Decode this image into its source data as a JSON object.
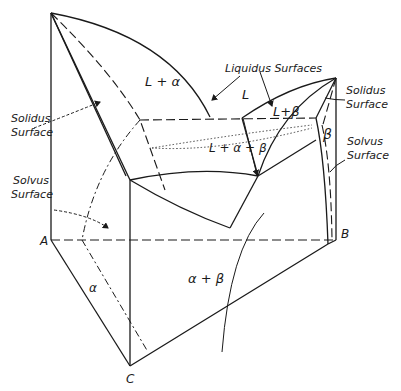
{
  "diagram": {
    "type": "ternary eutectic phase diagram (3D isometric)",
    "vertices": {
      "A": "A",
      "B": "B",
      "C": "C"
    },
    "regions": {
      "l_alpha": "L + α",
      "l": "L",
      "l_beta": "L+β",
      "l_alpha_beta": "L + α + β",
      "beta": "β",
      "alpha": "α",
      "alpha_beta": "α + β"
    },
    "callouts": {
      "liquidus": "Liquidus  Surfaces",
      "solidus_left_1": "Solidus",
      "solidus_left_2": "Surface",
      "solidus_right_1": "Solidus",
      "solidus_right_2": "Surface",
      "solvus_left_1": "Solvus",
      "solvus_left_2": "Surface",
      "solvus_right_1": "Solvus",
      "solvus_right_2": "Surface"
    },
    "colors": {
      "ink": "#1a1a1a",
      "paper": "#ffffff"
    }
  }
}
